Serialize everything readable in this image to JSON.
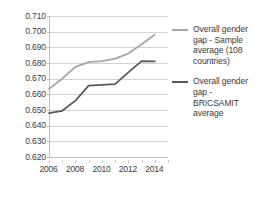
{
  "chart_data": {
    "type": "line",
    "title": "",
    "xlabel": "",
    "ylabel": "",
    "x": [
      2006,
      2007,
      2008,
      2009,
      2010,
      2011,
      2012,
      2013,
      2014
    ],
    "xlim": [
      2006,
      2015
    ],
    "ylim": [
      0.62,
      0.71
    ],
    "ytick_labels": [
      "0.710",
      "0.700",
      "0.690",
      "0.680",
      "0.670",
      "0.660",
      "0.650",
      "0.640",
      "0.630",
      "0.620"
    ],
    "ytick_values": [
      0.71,
      0.7,
      0.69,
      0.68,
      0.67,
      0.66,
      0.65,
      0.64,
      0.63,
      0.62
    ],
    "xtick_labels": [
      "2006",
      "2008",
      "2010",
      "2012",
      "2014"
    ],
    "xtick_values": [
      2006,
      2008,
      2010,
      2012,
      2014
    ],
    "grid": true,
    "legend_position": "right",
    "series": [
      {
        "name": "Overall gender gap - Sample average (108 countries)",
        "color": "#a6a6a6",
        "values": [
          0.6635,
          0.67,
          0.6775,
          0.6805,
          0.6812,
          0.6828,
          0.686,
          0.692,
          0.698
        ]
      },
      {
        "name": "Overall gender gap - BRICSAMIT average",
        "color": "#595959",
        "values": [
          0.648,
          0.6495,
          0.656,
          0.6655,
          0.666,
          0.6665,
          0.674,
          0.6812,
          0.681
        ]
      }
    ]
  },
  "legend": {
    "entries": [
      {
        "label": "Overall gender gap - Sample average (108 countries)",
        "color": "#a6a6a6"
      },
      {
        "label": "Overall gender gap - BRICSAMIT average",
        "color": "#595959"
      }
    ]
  }
}
